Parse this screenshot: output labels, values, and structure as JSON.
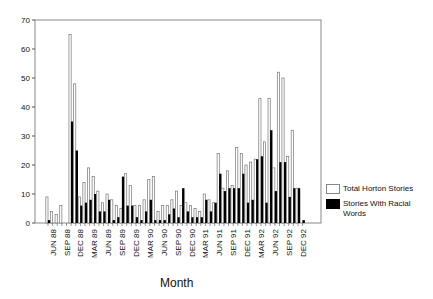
{
  "chart_data": {
    "type": "bar",
    "title": "",
    "xlabel": "Month",
    "ylabel": "",
    "ylim": [
      0,
      70
    ],
    "yticks": [
      0,
      10,
      20,
      30,
      40,
      50,
      60,
      70
    ],
    "grid": false,
    "legend_position": "right",
    "xtick_labels": [
      "JUN 88",
      "SEP 88",
      "DEC 88",
      "MAR 89",
      "JUN 89",
      "SEP 89",
      "DEC 89",
      "MAR 90",
      "JUN 90",
      "SEP 90",
      "DEC 90",
      "MAR 91",
      "JUN 91",
      "SEP 91",
      "DEC 91",
      "MAR 92",
      "JUN 92",
      "SEP 92",
      "DEC 92"
    ],
    "categories": [
      "MAY 88",
      "JUN 88",
      "JUL 88",
      "AUG 88",
      "SEP 88",
      "OCT 88",
      "NOV 88",
      "DEC 88",
      "JAN 89",
      "FEB 89",
      "MAR 89",
      "APR 89",
      "MAY 89",
      "JUN 89",
      "JUL 89",
      "AUG 89",
      "SEP 89",
      "OCT 89",
      "NOV 89",
      "DEC 89",
      "JAN 90",
      "FEB 90",
      "MAR 90",
      "APR 90",
      "MAY 90",
      "JUN 90",
      "JUL 90",
      "AUG 90",
      "SEP 90",
      "OCT 90",
      "NOV 90",
      "DEC 90",
      "JAN 91",
      "FEB 91",
      "MAR 91",
      "APR 91",
      "MAY 91",
      "JUN 91",
      "JUL 91",
      "AUG 91",
      "SEP 91",
      "OCT 91",
      "NOV 91",
      "DEC 91",
      "JAN 92",
      "FEB 92",
      "MAR 92",
      "APR 92",
      "MAY 92",
      "JUN 92",
      "JUL 92",
      "AUG 92",
      "SEP 92",
      "OCT 92",
      "NOV 92",
      "DEC 92"
    ],
    "series": [
      {
        "name": "Total Horton Stories",
        "color": "#ffffff",
        "values": [
          9,
          4,
          3,
          6,
          0,
          65,
          48,
          9,
          14,
          19,
          16,
          11,
          7,
          10,
          8,
          6,
          5,
          17,
          13,
          6,
          6,
          8,
          15,
          16,
          4,
          6,
          6,
          8,
          11,
          6,
          7,
          6,
          5,
          4,
          10,
          8,
          7,
          24,
          12,
          18,
          13,
          26,
          24,
          20,
          21,
          22,
          43,
          28,
          43,
          19,
          52,
          50,
          23,
          32,
          12,
          0
        ]
      },
      {
        "name": "Stories With Racial Words",
        "color": "#000000",
        "values": [
          1,
          0,
          0,
          0,
          0,
          35,
          25,
          6,
          7,
          8,
          10,
          4,
          4,
          8,
          1,
          2,
          16,
          6,
          6,
          2,
          1,
          4,
          8,
          1,
          1,
          1,
          3,
          5,
          2,
          12,
          4,
          2,
          2,
          2,
          8,
          4,
          7,
          17,
          11,
          12,
          12,
          12,
          17,
          7,
          8,
          22,
          23,
          7,
          32,
          11,
          21,
          21,
          9,
          12,
          12,
          1
        ]
      }
    ]
  },
  "axis": {
    "xlabel": "Month"
  },
  "legend": {
    "items": [
      {
        "label": "Total Horton Stories"
      },
      {
        "label": "Stories With Racial Words"
      }
    ]
  }
}
